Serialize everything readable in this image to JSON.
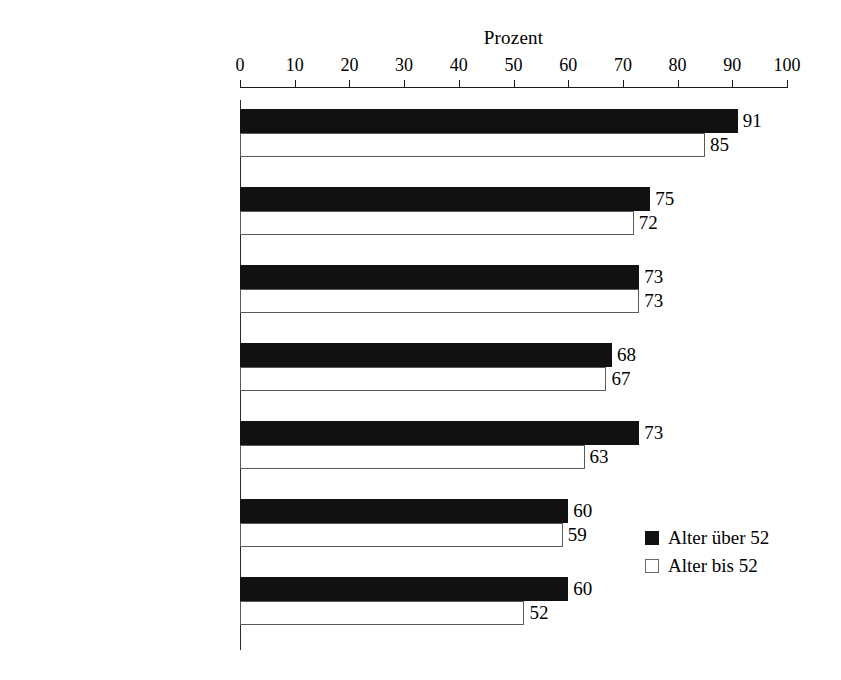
{
  "chart_data": {
    "type": "bar",
    "orientation": "horizontal",
    "title": "Prozent",
    "xlabel": "",
    "ylabel": "",
    "xlim": [
      0,
      100
    ],
    "xticks": [
      0,
      10,
      20,
      30,
      40,
      50,
      60,
      70,
      80,
      90,
      100
    ],
    "xtick_labels": [
      "0",
      "10",
      "20",
      "30",
      "40",
      "50",
      "60",
      "70",
      "80",
      "90",
      "100"
    ],
    "grid": false,
    "legend_position": "middle-right",
    "categories": [
      "Erleichterungen im\nAlltag",
      "Sicherheit erhöhen",
      "mehr Komfort im\nHaushalt",
      "dient als\nGedächtnisstütze",
      "Komm./Information\nerweitern",
      "Energie sparen",
      "Spaß am\nWochenende"
    ],
    "series": [
      {
        "name": "Alter über 52",
        "color": "#111111",
        "values": [
          91,
          75,
          73,
          68,
          73,
          60,
          60
        ],
        "value_labels": [
          "91",
          "75",
          "73",
          "68",
          "73",
          "60",
          "60"
        ]
      },
      {
        "name": "Alter bis 52",
        "color": "#ffffff",
        "values": [
          85,
          72,
          73,
          67,
          63,
          59,
          52
        ],
        "value_labels": [
          "85",
          "72",
          "73",
          "67",
          "63",
          "59",
          "52"
        ]
      }
    ]
  },
  "legend": {
    "items": [
      {
        "label": "Alter über 52",
        "style": "series-dark"
      },
      {
        "label": "Alter bis 52",
        "style": "series-light"
      }
    ]
  }
}
